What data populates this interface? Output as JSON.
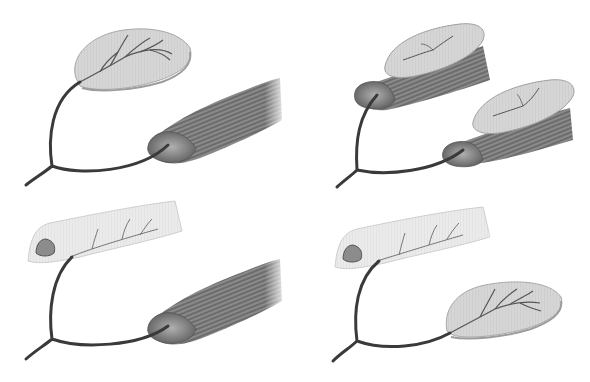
{
  "figure": {
    "background": "#ffffff",
    "colors": {
      "vessel": "#3a3a3a",
      "skin_fill": "#d4d4d4",
      "skin_edge": "#9a9a9a",
      "muscle_fill": "#7c7c7c",
      "muscle_stripe": "#4a4a4a",
      "muscle_end": "#9e9e9e",
      "bone_fill": "#e6e6e6",
      "bone_marrow": "#8a8a8a"
    },
    "panels": [
      {
        "id": "top-left",
        "description": "Skin flap and muscle flap on separate branches of a common vascular pedicle"
      },
      {
        "id": "top-right",
        "description": "Two musculocutaneous flaps on separate branches of a common pedicle"
      },
      {
        "id": "bottom-left",
        "description": "Bone flap and muscle flap on separate branches of a common pedicle"
      },
      {
        "id": "bottom-right",
        "description": "Bone flap and skin flap on separate branches of a common pedicle"
      }
    ]
  }
}
